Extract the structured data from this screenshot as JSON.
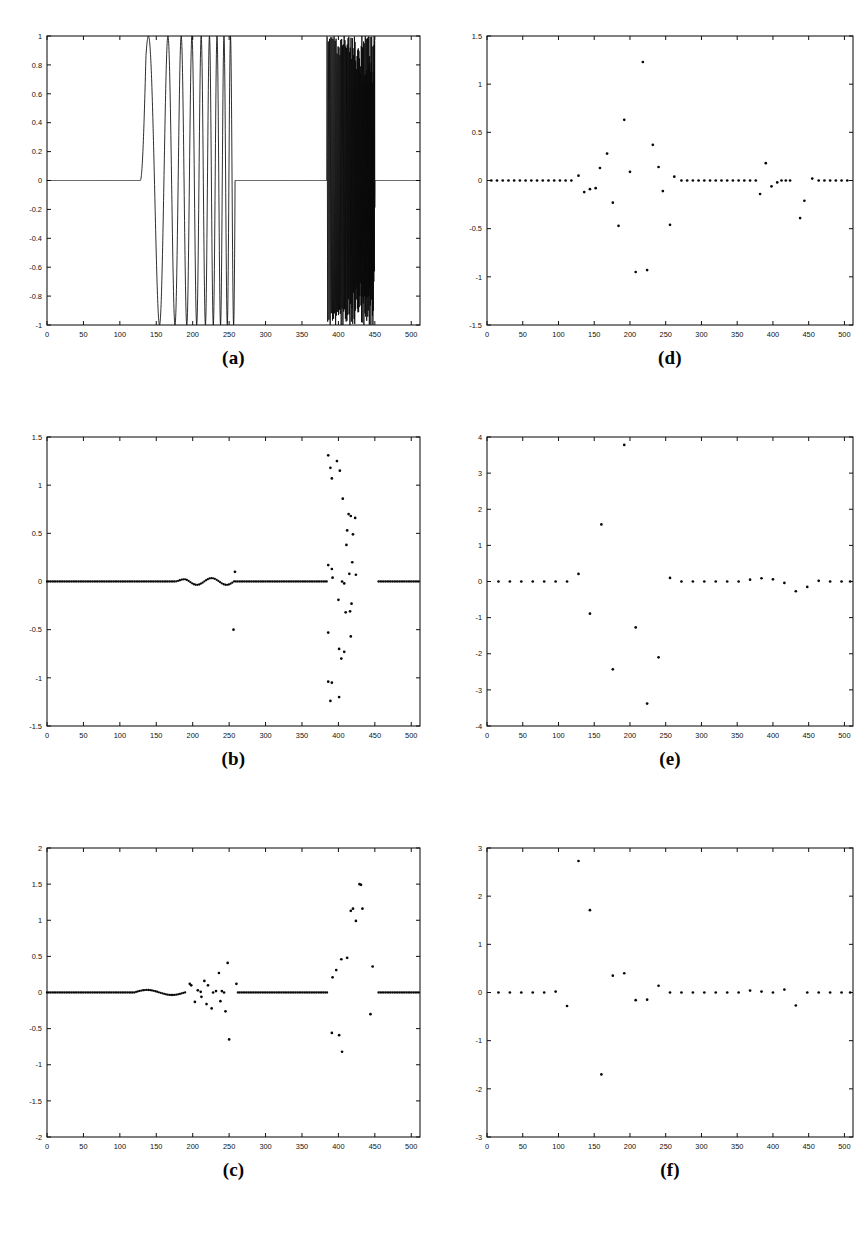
{
  "figure": {
    "background": "#ffffff",
    "ink": "#111111",
    "width": 866,
    "height": 1246,
    "layout": "2 columns x 3 rows of subplots, captions below each subplot"
  },
  "panels": [
    {
      "id": "a",
      "caption": "(a)",
      "grid_position": {
        "row": 1,
        "col": 1
      },
      "box": {
        "x": 47,
        "y": 36,
        "w": 373,
        "h": 289
      }
    },
    {
      "id": "b",
      "caption": "(b)",
      "grid_position": {
        "row": 2,
        "col": 1
      },
      "box": {
        "x": 47,
        "y": 437,
        "w": 373,
        "h": 289
      }
    },
    {
      "id": "c",
      "caption": "(c)",
      "grid_position": {
        "row": 3,
        "col": 1
      },
      "box": {
        "x": 47,
        "y": 848,
        "w": 373,
        "h": 289
      }
    },
    {
      "id": "d",
      "caption": "(d)",
      "grid_position": {
        "row": 1,
        "col": 2
      },
      "box": {
        "x": 487,
        "y": 36,
        "w": 366,
        "h": 289
      }
    },
    {
      "id": "e",
      "caption": "(e)",
      "grid_position": {
        "row": 2,
        "col": 2
      },
      "box": {
        "x": 487,
        "y": 437,
        "w": 366,
        "h": 289
      }
    },
    {
      "id": "f",
      "caption": "(f)",
      "grid_position": {
        "row": 3,
        "col": 2
      },
      "box": {
        "x": 487,
        "y": 848,
        "w": 366,
        "h": 289
      }
    }
  ],
  "chart_data": [
    {
      "panel": "a",
      "type": "line",
      "title": "(a)",
      "xlabel": "",
      "ylabel": "",
      "xlim": [
        0,
        512
      ],
      "ylim": [
        -1,
        1
      ],
      "xticks": [
        0,
        50,
        100,
        150,
        200,
        250,
        300,
        350,
        400,
        450,
        500
      ],
      "xticklabels": [
        "0",
        "50",
        "100",
        "150",
        "200",
        "250",
        "300",
        "350",
        "400",
        "450",
        "500"
      ],
      "yticks": [
        -1,
        -0.8,
        -0.6,
        -0.4,
        -0.2,
        0,
        0.2,
        0.4,
        0.6,
        0.8,
        1
      ],
      "yticklabels": [
        "-1",
        "-0.8",
        "-0.6",
        "-0.4",
        "-0.2",
        "0",
        "0.2",
        "0.4",
        "0.6",
        "0.8",
        "1"
      ],
      "grid": false,
      "legend": null,
      "description": "Composite test signal: flat zero baseline, a low-to-mid frequency chirp burst from sample 128 to 258 reaching amplitude +-1, zero again, then a dense high-frequency chirp burst from sample 384 to 450 reaching amplitude +-1, then zero to 512.",
      "segments": [
        {
          "name": "zero-baseline-1",
          "x_start": 0,
          "x_end": 128,
          "value": 0
        },
        {
          "name": "chirp-burst-1",
          "x_start": 128,
          "x_end": 258,
          "amplitude": 1.0,
          "cycles": 5,
          "freq_start": 0.018,
          "freq_end": 0.12
        },
        {
          "name": "zero-baseline-2",
          "x_start": 258,
          "x_end": 384,
          "value": 0
        },
        {
          "name": "chirp-burst-2",
          "x_start": 384,
          "x_end": 450,
          "amplitude": 1.0,
          "cycles": 38,
          "freq_start": 0.55,
          "freq_end": 1.5
        },
        {
          "name": "zero-baseline-3",
          "x_start": 450,
          "x_end": 512,
          "value": 0
        }
      ]
    },
    {
      "panel": "b",
      "type": "scatter",
      "title": "(b)",
      "xlabel": "",
      "ylabel": "",
      "xlim": [
        0,
        512
      ],
      "ylim": [
        -1.5,
        1.5
      ],
      "xticks": [
        0,
        50,
        100,
        150,
        200,
        250,
        300,
        350,
        400,
        450,
        500
      ],
      "xticklabels": [
        "0",
        "50",
        "100",
        "150",
        "200",
        "250",
        "300",
        "350",
        "400",
        "450",
        "500"
      ],
      "yticks": [
        -1.5,
        -1,
        -0.5,
        0,
        0.5,
        1,
        1.5
      ],
      "yticklabels": [
        "-1.5",
        "-1",
        "-0.5",
        "0",
        "0.5",
        "1",
        "1.5"
      ],
      "grid": false,
      "legend": null,
      "description": "Transform coefficients: near-zero dense baseline across all samples, gentle ripple near 180-255, one isolated point near (256, 0.1) and (256, -0.5), and a large vertically-scattered cluster of coefficients between samples 385 and 455 spanning -1.3 to +1.3.",
      "points": [
        [
          258,
          0.1
        ],
        [
          256,
          -0.5
        ],
        [
          386,
          1.31
        ],
        [
          389,
          1.18
        ],
        [
          391,
          1.07
        ],
        [
          398,
          1.25
        ],
        [
          402,
          1.15
        ],
        [
          406,
          0.86
        ],
        [
          414,
          0.7
        ],
        [
          417,
          0.68
        ],
        [
          423,
          0.66
        ],
        [
          412,
          0.53
        ],
        [
          420,
          0.49
        ],
        [
          411,
          0.38
        ],
        [
          386,
          0.17
        ],
        [
          391,
          0.13
        ],
        [
          419,
          0.2
        ],
        [
          415,
          0.08
        ],
        [
          424,
          0.07
        ],
        [
          392,
          0.04
        ],
        [
          405,
          0.0
        ],
        [
          408,
          -0.02
        ],
        [
          400,
          -0.19
        ],
        [
          418,
          -0.23
        ],
        [
          410,
          -0.32
        ],
        [
          416,
          -0.31
        ],
        [
          386,
          -0.53
        ],
        [
          417,
          -0.57
        ],
        [
          401,
          -0.7
        ],
        [
          408,
          -0.73
        ],
        [
          404,
          -0.8
        ],
        [
          386,
          -1.04
        ],
        [
          391,
          -1.05
        ],
        [
          401,
          -1.2
        ],
        [
          389,
          -1.24
        ]
      ],
      "baseline_note": "dense near-zero markers at every sample from 0 to 384 and 455 to 512"
    },
    {
      "panel": "c",
      "type": "scatter",
      "title": "(c)",
      "xlabel": "",
      "ylabel": "",
      "xlim": [
        0,
        512
      ],
      "ylim": [
        -2,
        2
      ],
      "xticks": [
        0,
        50,
        100,
        150,
        200,
        250,
        300,
        350,
        400,
        450,
        500
      ],
      "xticklabels": [
        "0",
        "50",
        "100",
        "150",
        "200",
        "250",
        "300",
        "350",
        "400",
        "450",
        "500"
      ],
      "yticks": [
        -2,
        -1.5,
        -1,
        -0.5,
        0,
        0.5,
        1,
        1.5,
        2
      ],
      "yticklabels": [
        "-2",
        "-1.5",
        "-1",
        "-0.5",
        "0",
        "0.5",
        "1",
        "1.5",
        "2"
      ],
      "grid": false,
      "legend": null,
      "description": "Transform coefficients: dense near-zero baseline, small ripple around 130-185, a moderate scatter cluster between 190 and 262 spanning -0.65 to +0.42, flat zero from 265 to 385, then a second cluster between 390 and 455 reaching +1.5 and -0.82.",
      "points": [
        [
          196,
          0.12
        ],
        [
          198,
          0.1
        ],
        [
          207,
          0.03
        ],
        [
          211,
          0.01
        ],
        [
          216,
          0.16
        ],
        [
          221,
          0.1
        ],
        [
          228,
          0.0
        ],
        [
          232,
          0.02
        ],
        [
          236,
          0.27
        ],
        [
          240,
          0.02
        ],
        [
          243,
          0.0
        ],
        [
          248,
          0.41
        ],
        [
          260,
          0.12
        ],
        [
          203,
          -0.13
        ],
        [
          212,
          -0.06
        ],
        [
          219,
          -0.16
        ],
        [
          226,
          -0.22
        ],
        [
          238,
          -0.12
        ],
        [
          245,
          -0.26
        ],
        [
          250,
          -0.65
        ],
        [
          392,
          0.21
        ],
        [
          397,
          0.31
        ],
        [
          404,
          0.46
        ],
        [
          412,
          0.48
        ],
        [
          417,
          1.13
        ],
        [
          420,
          1.16
        ],
        [
          424,
          0.99
        ],
        [
          429,
          1.5
        ],
        [
          431,
          1.49
        ],
        [
          433,
          1.16
        ],
        [
          447,
          0.36
        ],
        [
          391,
          -0.56
        ],
        [
          401,
          -0.59
        ],
        [
          405,
          -0.82
        ],
        [
          444,
          -0.3
        ]
      ],
      "baseline_note": "dense near-zero markers from 0 to 190, 262 to 385 and 455 to 512"
    },
    {
      "panel": "d",
      "type": "scatter",
      "title": "(d)",
      "xlabel": "",
      "ylabel": "",
      "xlim": [
        0,
        512
      ],
      "ylim": [
        -1.5,
        1.5
      ],
      "xticks": [
        0,
        50,
        100,
        150,
        200,
        250,
        300,
        350,
        400,
        450,
        500
      ],
      "xticklabels": [
        "0",
        "50",
        "100",
        "150",
        "200",
        "250",
        "300",
        "350",
        "400",
        "450",
        "500"
      ],
      "yticks": [
        -1.5,
        -1,
        -0.5,
        0,
        0.5,
        1,
        1.5
      ],
      "yticklabels": [
        "-1.5",
        "-1",
        "-0.5",
        "0",
        "0.5",
        "1",
        "1.5"
      ],
      "grid": false,
      "legend": null,
      "description": "Coarse coefficient sequence, roughly one marker every 8 samples, flat near zero except a burst of activity between samples 128 and 265 peaking at +1.23 near sample 218 and dipping to -0.95, plus a small tail of activity near 380-460.",
      "points": [
        [
          6,
          0.0
        ],
        [
          14,
          0.0
        ],
        [
          22,
          0.0
        ],
        [
          30,
          0.0
        ],
        [
          38,
          0.0
        ],
        [
          46,
          0.0
        ],
        [
          54,
          0.0
        ],
        [
          62,
          0.0
        ],
        [
          70,
          0.0
        ],
        [
          78,
          0.0
        ],
        [
          86,
          0.0
        ],
        [
          94,
          0.0
        ],
        [
          102,
          0.0
        ],
        [
          110,
          0.0
        ],
        [
          118,
          0.0
        ],
        [
          128,
          0.05
        ],
        [
          136,
          -0.12
        ],
        [
          144,
          -0.09
        ],
        [
          152,
          -0.08
        ],
        [
          158,
          0.13
        ],
        [
          168,
          0.28
        ],
        [
          176,
          -0.23
        ],
        [
          184,
          -0.47
        ],
        [
          192,
          0.63
        ],
        [
          200,
          0.09
        ],
        [
          208,
          -0.95
        ],
        [
          218,
          1.23
        ],
        [
          224,
          -0.93
        ],
        [
          232,
          0.37
        ],
        [
          240,
          0.14
        ],
        [
          246,
          -0.11
        ],
        [
          256,
          -0.46
        ],
        [
          262,
          0.04
        ],
        [
          272,
          0.0
        ],
        [
          280,
          0.0
        ],
        [
          288,
          0.0
        ],
        [
          296,
          0.0
        ],
        [
          304,
          0.0
        ],
        [
          312,
          0.0
        ],
        [
          320,
          0.0
        ],
        [
          328,
          0.0
        ],
        [
          336,
          0.0
        ],
        [
          344,
          0.0
        ],
        [
          352,
          0.0
        ],
        [
          360,
          0.0
        ],
        [
          368,
          0.0
        ],
        [
          376,
          0.0
        ],
        [
          382,
          -0.14
        ],
        [
          390,
          0.18
        ],
        [
          398,
          -0.06
        ],
        [
          406,
          -0.02
        ],
        [
          412,
          0.0
        ],
        [
          418,
          0.0
        ],
        [
          424,
          0.0
        ],
        [
          438,
          -0.39
        ],
        [
          444,
          -0.21
        ],
        [
          455,
          0.02
        ],
        [
          464,
          0.0
        ],
        [
          472,
          0.0
        ],
        [
          480,
          0.0
        ],
        [
          488,
          0.0
        ],
        [
          496,
          0.0
        ],
        [
          504,
          0.0
        ]
      ]
    },
    {
      "panel": "e",
      "type": "scatter",
      "title": "(e)",
      "xlabel": "",
      "ylabel": "",
      "xlim": [
        0,
        512
      ],
      "ylim": [
        -4,
        4
      ],
      "xticks": [
        0,
        50,
        100,
        150,
        200,
        250,
        300,
        350,
        400,
        450,
        500
      ],
      "xticklabels": [
        "0",
        "50",
        "100",
        "150",
        "200",
        "250",
        "300",
        "350",
        "400",
        "450",
        "500"
      ],
      "yticks": [
        -4,
        -3,
        -2,
        -1,
        0,
        1,
        2,
        3,
        4
      ],
      "yticklabels": [
        "-4",
        "-3",
        "-2",
        "-1",
        "0",
        "1",
        "2",
        "3",
        "4"
      ],
      "grid": false,
      "legend": null,
      "description": "Coarsest coefficient sequence, about one marker every 16 samples, flat near zero except large excursions between samples 128 and 240: +3.78 at 192, +1.58 at 160, -0.89 at 144, -2.43 at 176, -1.27 at 208, -3.38 at 224, -2.10 at 240.",
      "points": [
        [
          16,
          0.0
        ],
        [
          32,
          0.0
        ],
        [
          48,
          0.0
        ],
        [
          64,
          0.0
        ],
        [
          80,
          0.0
        ],
        [
          96,
          0.0
        ],
        [
          112,
          0.0
        ],
        [
          128,
          0.21
        ],
        [
          144,
          -0.89
        ],
        [
          160,
          1.58
        ],
        [
          176,
          -2.43
        ],
        [
          192,
          3.78
        ],
        [
          208,
          -1.27
        ],
        [
          224,
          -3.38
        ],
        [
          240,
          -2.1
        ],
        [
          256,
          0.1
        ],
        [
          272,
          0.0
        ],
        [
          288,
          0.0
        ],
        [
          304,
          0.0
        ],
        [
          320,
          0.0
        ],
        [
          336,
          0.0
        ],
        [
          352,
          0.0
        ],
        [
          368,
          0.05
        ],
        [
          384,
          0.09
        ],
        [
          400,
          0.06
        ],
        [
          416,
          -0.04
        ],
        [
          432,
          -0.27
        ],
        [
          448,
          -0.15
        ],
        [
          464,
          0.02
        ],
        [
          480,
          0.0
        ],
        [
          496,
          0.0
        ],
        [
          508,
          0.0
        ]
      ]
    },
    {
      "panel": "f",
      "type": "scatter",
      "title": "(f)",
      "xlabel": "",
      "ylabel": "",
      "xlim": [
        0,
        512
      ],
      "ylim": [
        -3,
        3
      ],
      "xticks": [
        0,
        50,
        100,
        150,
        200,
        250,
        300,
        350,
        400,
        450,
        500
      ],
      "xticklabels": [
        "0",
        "50",
        "100",
        "150",
        "200",
        "250",
        "300",
        "350",
        "400",
        "450",
        "500"
      ],
      "yticks": [
        -3,
        -2,
        -1,
        0,
        1,
        2,
        3
      ],
      "yticklabels": [
        "-3",
        "-2",
        "-1",
        "0",
        "1",
        "2",
        "3"
      ],
      "grid": false,
      "legend": null,
      "description": "Coarsest coefficient sequence, about one marker every 16 samples, flat near zero except large excursions between samples 110 and 240: +2.73 at 128, +1.71 at 144, -1.70 at 160, +0.35 at 176, +0.40 at 192, -0.28 at 112, +0.14 at 240.",
      "points": [
        [
          16,
          0.0
        ],
        [
          32,
          0.0
        ],
        [
          48,
          0.0
        ],
        [
          64,
          0.0
        ],
        [
          80,
          0.0
        ],
        [
          96,
          0.02
        ],
        [
          112,
          -0.28
        ],
        [
          128,
          2.73
        ],
        [
          144,
          1.71
        ],
        [
          160,
          -1.7
        ],
        [
          176,
          0.35
        ],
        [
          192,
          0.4
        ],
        [
          208,
          -0.16
        ],
        [
          224,
          -0.15
        ],
        [
          240,
          0.14
        ],
        [
          256,
          0.0
        ],
        [
          272,
          0.0
        ],
        [
          288,
          0.0
        ],
        [
          304,
          0.0
        ],
        [
          320,
          0.0
        ],
        [
          336,
          0.0
        ],
        [
          352,
          0.0
        ],
        [
          368,
          0.04
        ],
        [
          384,
          0.02
        ],
        [
          400,
          0.0
        ],
        [
          416,
          0.06
        ],
        [
          432,
          -0.27
        ],
        [
          448,
          0.0
        ],
        [
          464,
          0.0
        ],
        [
          480,
          0.0
        ],
        [
          496,
          0.0
        ],
        [
          508,
          0.0
        ]
      ]
    }
  ]
}
